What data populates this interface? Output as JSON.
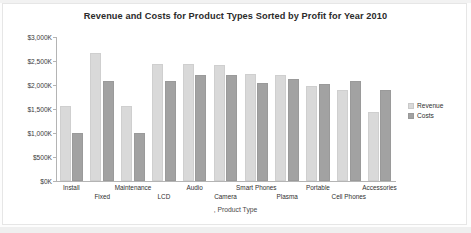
{
  "chart_data": {
    "type": "bar",
    "title": "Revenue and Costs for Product Types Sorted by Profit for Year 2010",
    "xlabel": ", Product Type",
    "ylabel": "",
    "categories": [
      "Install",
      "Fixed",
      "Maintenance",
      "LCD",
      "Audio",
      "Camera",
      "Smart Phones",
      "Plasma",
      "Portable",
      "Cell Phones",
      "Accessories"
    ],
    "series": [
      {
        "name": "Revenue",
        "color": "#d9d9d9",
        "values": [
          1570,
          2660,
          1560,
          2430,
          2430,
          2420,
          2220,
          2210,
          1980,
          1900,
          1430
        ]
      },
      {
        "name": "Costs",
        "color": "#a2a2a2",
        "values": [
          1000,
          2080,
          1000,
          2080,
          2200,
          2200,
          2040,
          2130,
          2020,
          2080,
          1890
        ]
      }
    ],
    "ylim": [
      0,
      3000
    ],
    "yticks": [
      0,
      500,
      1000,
      1500,
      2000,
      2500,
      3000
    ],
    "ytick_labels": [
      "$0K",
      "$500K",
      "$1,000K",
      "$1,500K",
      "$2,000K",
      "$2,500K",
      "$3,000K"
    ],
    "grid": false,
    "legend_position": "right"
  },
  "legend": {
    "items": [
      {
        "label": "Revenue"
      },
      {
        "label": "Costs"
      }
    ]
  }
}
